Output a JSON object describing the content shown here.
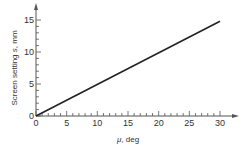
{
  "chart_data": {
    "type": "line",
    "title": "",
    "xlabel": "μ, deg",
    "xlabel_parts": {
      "symbol": "μ",
      "rest": ", deg"
    },
    "ylabel": "Screen setting s, mm",
    "ylabel_parts": {
      "prefix": "Screen setting ",
      "symbol": "s",
      "rest": ", mm"
    },
    "xlim": [
      0,
      30
    ],
    "ylim": [
      0,
      15
    ],
    "xticks": [
      0,
      5,
      10,
      15,
      20,
      25,
      30
    ],
    "yticks": [
      0,
      5,
      10,
      15
    ],
    "x_minor_step": 1,
    "y_minor_step": 1,
    "grid": false,
    "legend": null,
    "series": [
      {
        "name": "Screen setting",
        "x": [
          0,
          30
        ],
        "values": [
          0,
          14.8
        ],
        "color": "#222222"
      }
    ]
  }
}
